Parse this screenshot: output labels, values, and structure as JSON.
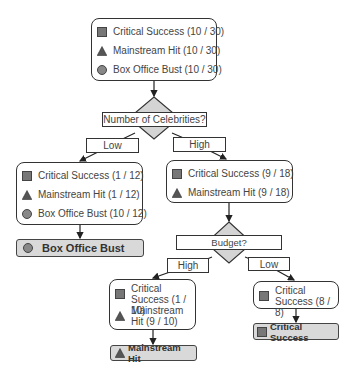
{
  "colors": {
    "icon_fill": "#777777",
    "icon_stroke": "#444444",
    "diamond_fill": "#d4d4d4",
    "leaf_fill": "#d9d9d9"
  },
  "root": {
    "rows": [
      {
        "icon": "square-icon",
        "text": "Critical Success (10 / 30)"
      },
      {
        "icon": "triangle-icon",
        "text": "Mainstream Hit (10 / 30)"
      },
      {
        "icon": "circle-icon",
        "text": "Box Office Bust (10 / 30)"
      }
    ]
  },
  "split1": {
    "question": "Number of Celebrities?",
    "left_label": "Low",
    "right_label": "High"
  },
  "low_node": {
    "rows": [
      {
        "icon": "square-icon",
        "text": "Critical Success (1 / 12)"
      },
      {
        "icon": "triangle-icon",
        "text": "Mainstream Hit (1 / 12)"
      },
      {
        "icon": "circle-icon",
        "text": "Box Office Bust (10 / 12)"
      }
    ],
    "leaf": {
      "icon": "circle-icon",
      "text": "Box Office Bust"
    }
  },
  "high_node": {
    "rows": [
      {
        "icon": "square-icon",
        "text": "Critical Success (9 / 18)"
      },
      {
        "icon": "triangle-icon",
        "text": "Mainstream Hit (9 / 18)"
      }
    ]
  },
  "split2": {
    "question": "Budget?",
    "left_label": "High",
    "right_label": "Low"
  },
  "budget_high_node": {
    "rows": [
      {
        "icon": "square-icon",
        "text": "Critical Success (1 / 10)"
      },
      {
        "icon": "triangle-icon",
        "text": "Mainstream Hit (9 / 10)"
      }
    ],
    "leaf": {
      "icon": "triangle-icon",
      "text": "Mainstream Hit"
    }
  },
  "budget_low_node": {
    "rows": [
      {
        "icon": "square-icon",
        "text": "Critical Success (8 / 8)"
      }
    ],
    "leaf": {
      "icon": "square-icon",
      "text": "Critical Success"
    }
  }
}
